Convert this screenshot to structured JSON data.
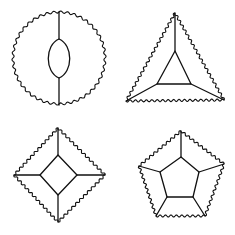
{
  "figure": {
    "stroke_color": "#111111",
    "background": "#ffffff"
  },
  "shapes": [
    {
      "name": "digon-circle",
      "outer": {
        "type": "circle",
        "cx": 59,
        "cy": 58,
        "r": 46
      },
      "inner": {
        "type": "lens",
        "top": [
          59,
          39
        ],
        "bottom": [
          59,
          78
        ],
        "half_width": 11
      },
      "spokes": [
        [
          [
            59,
            12
          ],
          [
            59,
            39
          ]
        ],
        [
          [
            59,
            78
          ],
          [
            59,
            105
          ]
        ]
      ]
    },
    {
      "name": "triangle",
      "outer": [
        [
          175,
          13
        ],
        [
          224,
          100
        ],
        [
          126,
          101
        ]
      ],
      "inner": [
        [
          175,
          51
        ],
        [
          191,
          84
        ],
        [
          157,
          84
        ]
      ]
    },
    {
      "name": "diamond",
      "outer": [
        [
          58,
          128
        ],
        [
          105,
          175
        ],
        [
          58,
          222
        ],
        [
          14,
          175
        ]
      ],
      "inner": [
        [
          58,
          155
        ],
        [
          77,
          175
        ],
        [
          58,
          195
        ],
        [
          40,
          175
        ]
      ]
    },
    {
      "name": "pentagon",
      "outer": [
        [
          181,
          131
        ],
        [
          224,
          164
        ],
        [
          205,
          216
        ],
        [
          156,
          216
        ],
        [
          139,
          166
        ]
      ],
      "inner": [
        [
          181,
          157
        ],
        [
          199,
          172
        ],
        [
          193,
          197
        ],
        [
          167,
          197
        ],
        [
          160,
          172
        ]
      ]
    }
  ]
}
